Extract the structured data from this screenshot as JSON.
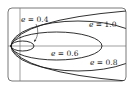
{
  "figure": {
    "colors": {
      "curve": "#1a1a1a",
      "frame": "#555555",
      "axis": "#777777",
      "background": "#ffffff"
    },
    "curves": [
      {
        "eccentricity": 0.4,
        "type": "ellipse",
        "label": "e = 0.4"
      },
      {
        "eccentricity": 0.6,
        "type": "ellipse",
        "label": "e = 0.6"
      },
      {
        "eccentricity": 0.8,
        "type": "ellipse",
        "label": "e = 0.8"
      },
      {
        "eccentricity": 1.0,
        "type": "parabola",
        "label": "e = 1.0"
      }
    ],
    "labels": {
      "e04": {
        "var": "e",
        "eq": " = 0.4"
      },
      "e06": {
        "var": "e",
        "eq": " = 0.6"
      },
      "e08": {
        "var": "e",
        "eq": " = 0.8"
      },
      "e10": {
        "var": "e",
        "eq": " = 1.0"
      }
    }
  }
}
